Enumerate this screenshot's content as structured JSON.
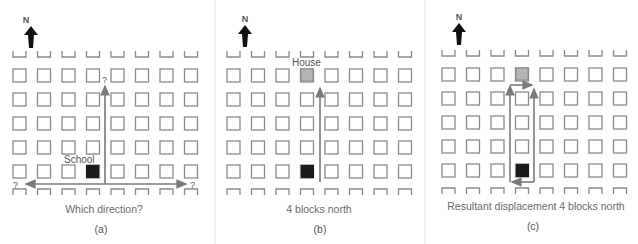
{
  "figure": {
    "compass_label": "N",
    "colors": {
      "grid": "#8a8a8a",
      "school": "#1a1a1a",
      "house": "#b5b5b5",
      "arrow": "#7a7a7a",
      "text": "#555555"
    },
    "panels": [
      {
        "id": "a",
        "caption": "Which direction?",
        "sublabel": "(a)",
        "place_label": "School",
        "question_marks": [
          "?",
          "?",
          "?"
        ]
      },
      {
        "id": "b",
        "caption": "4 blocks north",
        "sublabel": "(b)",
        "place_label": "House"
      },
      {
        "id": "c",
        "caption": "Resultant displacement 4 blocks north",
        "sublabel": "(c)"
      }
    ],
    "grid": {
      "columns": 8,
      "full_rows": 5
    }
  }
}
